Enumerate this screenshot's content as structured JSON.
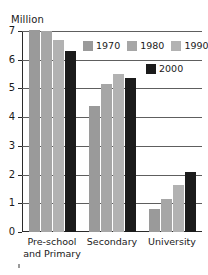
{
  "chart_data": {
    "type": "bar",
    "title": "",
    "subtitle": "",
    "xlabel": "",
    "ylabel": "Million",
    "ylim": [
      0,
      7
    ],
    "ytick_labels": [
      "7",
      "6",
      "5",
      "4",
      "3",
      "2",
      "1",
      "0"
    ],
    "ytick_values": [
      7,
      6,
      5,
      4,
      3,
      2,
      1,
      0
    ],
    "grid": true,
    "legend_position": "top-right",
    "categories": [
      "Pre-school and Primary",
      "Secondary",
      "University"
    ],
    "category_lines": [
      [
        "Pre-school",
        "and Primary"
      ],
      [
        "Secondary"
      ],
      [
        "University"
      ]
    ],
    "series": [
      {
        "name": "1970",
        "color": "#9a9a9a",
        "values": [
          7.05,
          4.4,
          0.8
        ]
      },
      {
        "name": "1980",
        "color": "#a6a6a6",
        "values": [
          7.0,
          5.15,
          1.15
        ]
      },
      {
        "name": "1990",
        "color": "#b2b2b2",
        "values": [
          6.7,
          5.5,
          1.65
        ]
      },
      {
        "name": "2000",
        "color": "#1b1b1b",
        "values": [
          6.3,
          5.35,
          2.1
        ]
      }
    ]
  },
  "legend": {
    "row1": [
      "1970",
      "1980",
      "1990"
    ],
    "row2": [
      "2000"
    ]
  },
  "colors": {
    "axis": "#2b2b2b",
    "gridline": "#5e5e5e",
    "text": "#1a1a1a",
    "series_1970": "#9a9a9a",
    "series_1980": "#a6a6a6",
    "series_1990": "#b2b2b2",
    "series_2000": "#1b1b1b",
    "background": "#ffffff"
  }
}
